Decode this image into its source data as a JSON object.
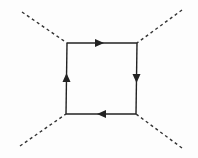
{
  "diagram": {
    "type": "feynman-box-diagram",
    "colors": {
      "line": "#222222",
      "dashed": "#333333",
      "background": "#fdfdfd"
    },
    "loop_corners": {
      "tl": [
        67,
        43
      ],
      "tr": [
        137,
        43
      ],
      "br": [
        136,
        114
      ],
      "bl": [
        66,
        114
      ]
    },
    "external_lines": [
      {
        "name": "external-scalar-top-left",
        "from": [
          22,
          12
        ],
        "to": [
          67,
          43
        ],
        "style": "dashed"
      },
      {
        "name": "external-scalar-top-right",
        "from": [
          182,
          10
        ],
        "to": [
          137,
          43
        ],
        "style": "dashed"
      },
      {
        "name": "external-scalar-bottom-left",
        "from": [
          20,
          146
        ],
        "to": [
          66,
          114
        ],
        "style": "dashed"
      },
      {
        "name": "external-scalar-bottom-right",
        "from": [
          182,
          148
        ],
        "to": [
          136,
          114
        ],
        "style": "dashed"
      }
    ],
    "propagators": [
      {
        "name": "fermion-top",
        "direction": "right"
      },
      {
        "name": "fermion-right",
        "direction": "down"
      },
      {
        "name": "fermion-bottom",
        "direction": "left"
      },
      {
        "name": "fermion-left",
        "direction": "up"
      }
    ]
  }
}
